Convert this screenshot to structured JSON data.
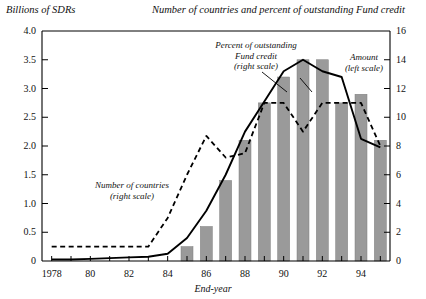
{
  "header": {
    "left_title": "Billions of SDRs",
    "right_title": "Number of countries and percent of outstanding Fund credit"
  },
  "annotations": {
    "countries": {
      "line1": "Number of countries",
      "line2": "(right scale)"
    },
    "percent": {
      "line1": "Percent of outstanding",
      "line2": "Fund credit",
      "line3": "(right scale)"
    },
    "amount": {
      "line1": "Amount",
      "line2": "(left scale)"
    }
  },
  "colors": {
    "bar": "#9a9a9a",
    "bar_edge": "#7d7d7d",
    "line_solid": "#000000",
    "line_dashed": "#000000",
    "axis": "#000000",
    "background": "#ffffff"
  },
  "chart_data": {
    "type": "bar",
    "title": "Number of countries and percent of outstanding Fund credit",
    "xlabel": "End-year",
    "ylabel": "Billions of SDRs",
    "y2label": "Number of countries and percent of outstanding Fund credit",
    "ylim": [
      0,
      4.0
    ],
    "y2lim": [
      0,
      16
    ],
    "yticks": [
      "0",
      "0.5",
      "1.0",
      "1.5",
      "2.0",
      "2.5",
      "3.0",
      "3.5",
      "4.0"
    ],
    "ytick_values": [
      0,
      0.5,
      1.0,
      1.5,
      2.0,
      2.5,
      3.0,
      3.5,
      4.0
    ],
    "y2ticks": [
      "0",
      "2",
      "4",
      "6",
      "8",
      "10",
      "12",
      "14",
      "16"
    ],
    "y2tick_values": [
      0,
      2,
      4,
      6,
      8,
      10,
      12,
      14,
      16
    ],
    "x": [
      1978,
      1979,
      1980,
      1981,
      1982,
      1983,
      1984,
      1985,
      1986,
      1987,
      1988,
      1989,
      1990,
      1991,
      1992,
      1993,
      1994,
      1995
    ],
    "xtick_labels": [
      "1978",
      "80",
      "82",
      "84",
      "86",
      "88",
      "90",
      "92",
      "94"
    ],
    "xtick_values": [
      1978,
      1980,
      1982,
      1984,
      1986,
      1988,
      1990,
      1992,
      1994
    ],
    "grid": false,
    "legend": "annotations-inline",
    "series": [
      {
        "name": "Amount",
        "type": "bar",
        "axis": "left",
        "units": "Billions of SDRs",
        "values": [
          0,
          0,
          0,
          0,
          0,
          0,
          0,
          0.25,
          0.6,
          1.4,
          2.1,
          2.75,
          3.2,
          3.5,
          3.5,
          2.75,
          2.9,
          2.1
        ]
      },
      {
        "name": "Number of countries",
        "type": "line-dashed",
        "axis": "right",
        "units": "countries",
        "values": [
          1,
          1,
          1,
          1,
          1,
          1,
          3,
          6,
          8.7,
          7.2,
          7.5,
          11.0,
          11.0,
          9.0,
          11.0,
          11.0,
          11.0,
          8.0
        ]
      },
      {
        "name": "Percent of outstanding Fund credit",
        "type": "line-solid",
        "axis": "right",
        "units": "percent",
        "values": [
          0.1,
          0.1,
          0.15,
          0.2,
          0.25,
          0.3,
          0.5,
          1.6,
          3.5,
          6.0,
          9.0,
          11.1,
          13.2,
          14.0,
          13.2,
          12.8,
          8.5,
          7.9
        ]
      }
    ]
  }
}
